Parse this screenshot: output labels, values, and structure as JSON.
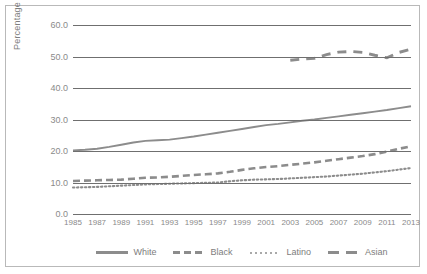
{
  "chart_data": {
    "type": "line",
    "title": "",
    "xlabel": "",
    "ylabel": "Percentage",
    "ylim": [
      0.0,
      60.0
    ],
    "yticks": [
      "0.0",
      "10.0",
      "20.0",
      "30.0",
      "40.0",
      "50.0",
      "60.0"
    ],
    "ytick_values": [
      0.0,
      10.0,
      20.0,
      30.0,
      40.0,
      50.0,
      60.0
    ],
    "grid": true,
    "legend_position": "bottom",
    "categories": [
      "1985",
      "1986",
      "1987",
      "1988",
      "1989",
      "1990",
      "1991",
      "1992",
      "1993",
      "1994",
      "1995",
      "1996",
      "1997",
      "1998",
      "1999",
      "2000",
      "2001",
      "2002",
      "2003",
      "2004",
      "2005",
      "2006",
      "2007",
      "2008",
      "2009",
      "2010",
      "2011",
      "2012",
      "2013"
    ],
    "xtick_labels": [
      "1985",
      "1987",
      "1989",
      "1991",
      "1993",
      "1995",
      "1997",
      "1999",
      "2001",
      "2003",
      "2005",
      "2007",
      "2009",
      "2011",
      "2013"
    ],
    "series": [
      {
        "name": "White",
        "style": "solid",
        "color": "#8c8c8c",
        "values": [
          20.2,
          20.4,
          20.7,
          21.3,
          22.0,
          22.7,
          23.2,
          23.4,
          23.6,
          24.1,
          24.6,
          25.2,
          25.8,
          26.4,
          27.0,
          27.6,
          28.2,
          28.6,
          29.1,
          29.6,
          30.0,
          30.5,
          31.0,
          31.5,
          32.0,
          32.5,
          33.0,
          33.6,
          34.2
        ]
      },
      {
        "name": "Black",
        "style": "dashed",
        "color": "#8c8c8c",
        "values": [
          10.5,
          10.6,
          10.7,
          10.8,
          10.9,
          11.2,
          11.5,
          11.6,
          11.8,
          12.1,
          12.4,
          12.6,
          12.9,
          13.4,
          14.0,
          14.5,
          14.9,
          15.2,
          15.6,
          16.0,
          16.4,
          16.9,
          17.4,
          17.9,
          18.4,
          19.0,
          19.8,
          20.7,
          21.5
        ]
      },
      {
        "name": "Latino",
        "style": "dotted",
        "color": "#8c8c8c",
        "values": [
          8.4,
          8.5,
          8.6,
          8.8,
          9.0,
          9.2,
          9.4,
          9.5,
          9.6,
          9.7,
          9.8,
          9.9,
          10.0,
          10.4,
          10.7,
          10.9,
          11.0,
          11.1,
          11.3,
          11.5,
          11.7,
          11.9,
          12.2,
          12.5,
          12.8,
          13.2,
          13.6,
          14.1,
          14.6
        ]
      },
      {
        "name": "Asian",
        "style": "longdash",
        "color": "#8c8c8c",
        "start_category": "2003",
        "values": [
          null,
          null,
          null,
          null,
          null,
          null,
          null,
          null,
          null,
          null,
          null,
          null,
          null,
          null,
          null,
          null,
          null,
          null,
          48.8,
          49.2,
          49.4,
          50.6,
          51.4,
          51.6,
          51.3,
          50.4,
          49.6,
          51.3,
          52.3
        ]
      }
    ],
    "legend": [
      {
        "label": "White",
        "style": "solid"
      },
      {
        "label": "Black",
        "style": "dashed"
      },
      {
        "label": "Latino",
        "style": "dotted"
      },
      {
        "label": "Asian",
        "style": "longdash"
      }
    ]
  }
}
